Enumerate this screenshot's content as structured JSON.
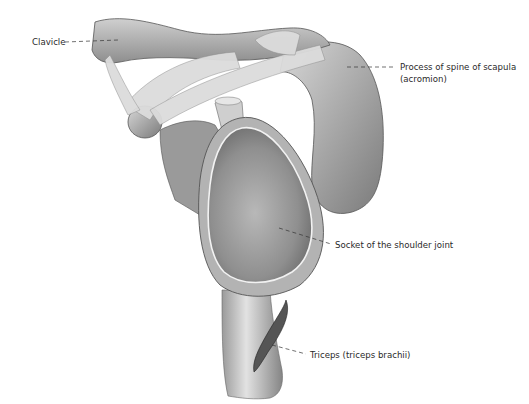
{
  "figure": {
    "background": "#ffffff",
    "ink_color": "#333333"
  },
  "labels": [
    {
      "id": "clavicle",
      "text": "Clavicle",
      "x": 32,
      "y": 37,
      "leader_to": [
        118,
        42
      ]
    },
    {
      "id": "acromion",
      "line1": "Process of spine of scapula",
      "line2": "(acromion)",
      "x": 400,
      "y": 63,
      "leader_to": [
        347,
        67
      ]
    },
    {
      "id": "socket",
      "text": "Socket of the shoulder joint",
      "x": 335,
      "y": 240,
      "leader_to": [
        279,
        228
      ]
    },
    {
      "id": "triceps",
      "text": "Triceps (triceps brachii)",
      "x": 310,
      "y": 350,
      "leader_to": [
        272,
        345
      ]
    }
  ]
}
